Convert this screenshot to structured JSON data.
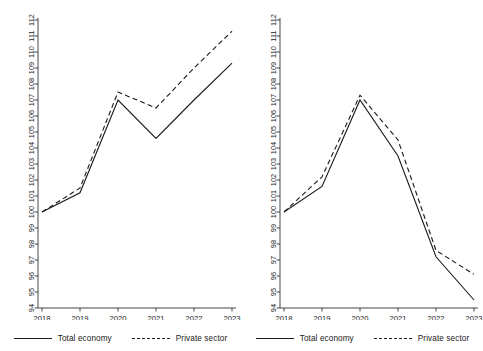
{
  "chart_data": [
    {
      "panel": "left",
      "type": "line",
      "title": "",
      "xlabel": "",
      "ylabel": "",
      "x": [
        "2018",
        "2019",
        "2020",
        "2021",
        "2022",
        "2023"
      ],
      "categories": [
        "2018",
        "2019",
        "2020",
        "2021",
        "2022",
        "2023"
      ],
      "ylim": [
        94,
        112
      ],
      "yticks": [
        94,
        95,
        96,
        97,
        98,
        99,
        100,
        101,
        102,
        103,
        104,
        105,
        106,
        107,
        108,
        109,
        110,
        111,
        112
      ],
      "ytick_labels": [
        "94",
        "95",
        "96",
        "97",
        "98",
        "99",
        "100",
        "101",
        "102",
        "103",
        "104",
        "105",
        "106",
        "107",
        "108",
        "109",
        "110",
        "111",
        "112"
      ],
      "grid": false,
      "legend_position": "bottom",
      "series": [
        {
          "name": "Total economy",
          "style": "solid",
          "values": [
            100.0,
            101.2,
            107.0,
            104.6,
            107.0,
            109.3
          ]
        },
        {
          "name": "Private sector",
          "style": "dashed",
          "values": [
            100.0,
            101.5,
            107.5,
            106.5,
            109.0,
            111.3
          ]
        }
      ]
    },
    {
      "panel": "right",
      "type": "line",
      "title": "",
      "xlabel": "",
      "ylabel": "",
      "x": [
        "2018",
        "2019",
        "2020",
        "2021",
        "2022",
        "2023"
      ],
      "categories": [
        "2018",
        "2019",
        "2020",
        "2021",
        "2022",
        "2023"
      ],
      "ylim": [
        94,
        112
      ],
      "yticks": [
        94,
        95,
        96,
        97,
        98,
        99,
        100,
        101,
        102,
        103,
        104,
        105,
        106,
        107,
        108,
        109,
        110,
        111,
        112
      ],
      "ytick_labels": [
        "94",
        "95",
        "96",
        "97",
        "98",
        "99",
        "100",
        "101",
        "102",
        "103",
        "104",
        "105",
        "106",
        "107",
        "108",
        "109",
        "110",
        "111",
        "112"
      ],
      "grid": false,
      "legend_position": "bottom",
      "series": [
        {
          "name": "Total economy",
          "style": "solid",
          "values": [
            100.0,
            101.6,
            107.0,
            103.5,
            97.2,
            94.5
          ]
        },
        {
          "name": "Private sector",
          "style": "dashed",
          "values": [
            100.0,
            102.2,
            107.3,
            104.5,
            97.6,
            96.1
          ]
        }
      ]
    }
  ],
  "legend": {
    "total_economy": "Total economy",
    "private_sector": "Private sector"
  },
  "colors": {
    "line": "#1a1a1a",
    "axis": "#1a1a1a",
    "background": "#ffffff"
  }
}
